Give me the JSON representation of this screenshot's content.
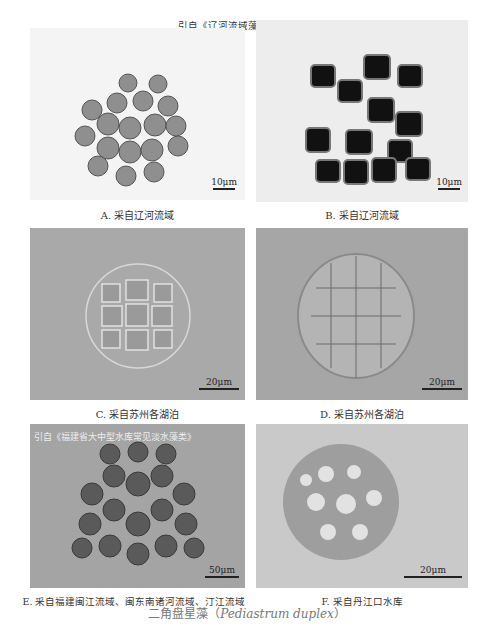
{
  "source_top": "引自《辽河流域藻类监测图鉴》",
  "source_e": "引自《福建省大中型水库常见淡水藻类》",
  "panels": [
    {
      "id": "A",
      "caption": "A. 采自辽河流域",
      "scale": "10μm",
      "bg": "#f4f4f4"
    },
    {
      "id": "B",
      "caption": "B. 采自辽河流域",
      "scale": "10μm",
      "bg": "#ededed"
    },
    {
      "id": "C",
      "caption": "C. 采自苏州各湖泊",
      "scale": "20μm",
      "bg": "#a9a9a9"
    },
    {
      "id": "D",
      "caption": "D. 采自苏州各湖泊",
      "scale": "20μm",
      "bg": "#a6a6a6"
    },
    {
      "id": "E",
      "caption": "E. 采自福建闽江流域、闽东南诸河流域、汀江流域",
      "scale": "50μm",
      "bg": "#a4a4a4"
    },
    {
      "id": "F",
      "caption": "F. 采自丹江口水库",
      "scale": "20μm",
      "bg": "#c9c9c9"
    }
  ],
  "figure_title": {
    "cn": "二角盘星藻（",
    "latin": "Pediastrum duplex",
    "close": "）"
  }
}
